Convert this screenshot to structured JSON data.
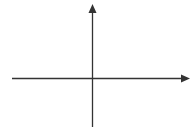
{
  "diagram": {
    "type": "coordinate-axes",
    "line_color": "#333333",
    "background_color": "#ffffff",
    "origin": {
      "x": 92.5,
      "y": 78.5
    },
    "x_axis": {
      "start": {
        "x": 12,
        "y": 78.5
      },
      "end": {
        "x": 181,
        "y": 78.5
      },
      "arrow_tip": {
        "x": 190,
        "y": 78.5
      },
      "direction": "right",
      "label": ""
    },
    "y_axis": {
      "start": {
        "x": 92.5,
        "y": 127
      },
      "end": {
        "x": 92.5,
        "y": 13
      },
      "arrow_tip": {
        "x": 92.5,
        "y": 4
      },
      "direction": "up",
      "label": ""
    }
  }
}
